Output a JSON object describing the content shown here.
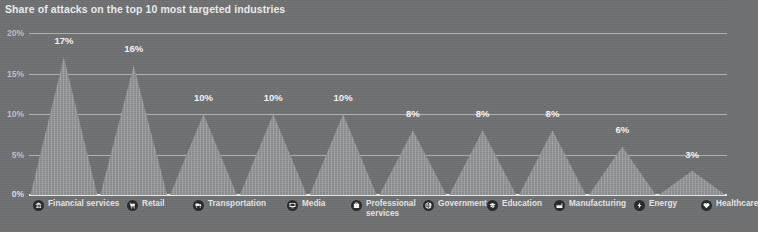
{
  "chart_data": {
    "type": "bar",
    "title": "Share of attacks on the top 10 most targeted industries",
    "xlabel": "",
    "ylabel": "",
    "ylim": [
      0,
      20
    ],
    "yticks": [
      "0%",
      "5%",
      "10%",
      "15%",
      "20%"
    ],
    "ytick_values": [
      0,
      5,
      10,
      15,
      20
    ],
    "grid": true,
    "legend_position": "bottom",
    "unit": "%",
    "categories": [
      "Financial services",
      "Retail",
      "Transportation",
      "Media",
      "Professional services",
      "Government",
      "Education",
      "Manufacturing",
      "Energy",
      "Healthcare"
    ],
    "values": [
      17,
      16,
      10,
      10,
      10,
      8,
      8,
      8,
      6,
      3
    ],
    "value_labels": [
      "17%",
      "16%",
      "10%",
      "10%",
      "10%",
      "8%",
      "8%",
      "8%",
      "6%",
      "3%"
    ],
    "series": [
      {
        "name": "Share of attacks",
        "values": [
          17,
          16,
          10,
          10,
          10,
          8,
          8,
          8,
          6,
          3
        ]
      }
    ]
  },
  "legend": {
    "items": [
      {
        "label": "Financial services",
        "icon": "bank-icon"
      },
      {
        "label": "Retail",
        "icon": "shopping-cart-icon"
      },
      {
        "label": "Transportation",
        "icon": "truck-icon"
      },
      {
        "label": "Media",
        "icon": "monitor-icon"
      },
      {
        "label": "Professional services",
        "icon": "briefcase-icon"
      },
      {
        "label": "Government",
        "icon": "globe-icon"
      },
      {
        "label": "Education",
        "icon": "graduation-cap-icon"
      },
      {
        "label": "Manufacturing",
        "icon": "factory-icon"
      },
      {
        "label": "Energy",
        "icon": "lightning-bolt-icon"
      },
      {
        "label": "Healthcare",
        "icon": "heart-pulse-icon"
      }
    ]
  },
  "colors": {
    "background": "#6f7072",
    "spike_fill": "#8e8f91",
    "gridline": "#c9cacb",
    "baseline": "#e7e8e9",
    "text": "#e9eaea",
    "icon_badge": "#2a2b2d"
  }
}
